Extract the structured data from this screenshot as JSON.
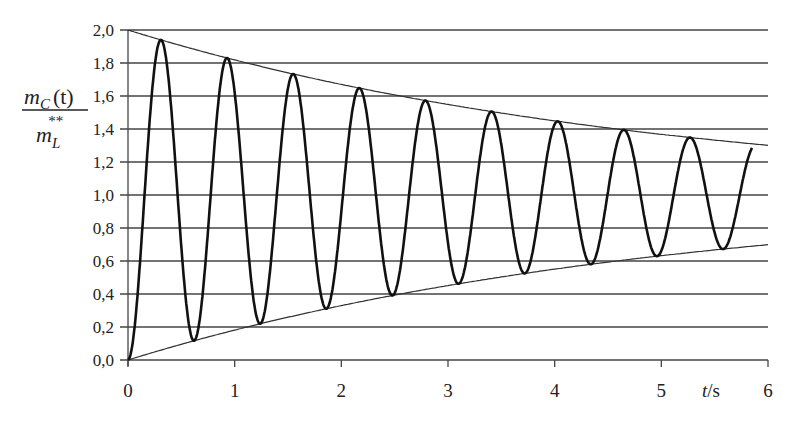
{
  "chart_data": {
    "type": "line",
    "title": "",
    "xlabel": "t/s",
    "ylabel": "m_C(t) / m_L**",
    "xlim": [
      0,
      6
    ],
    "ylim": [
      0,
      2.0
    ],
    "x_ticks": [
      "0",
      "1",
      "2",
      "3",
      "4",
      "5",
      "6"
    ],
    "y_ticks": [
      "0,0",
      "0,2",
      "0,4",
      "0,6",
      "0,8",
      "1,0",
      "1,2",
      "1,4",
      "1,6",
      "1,8",
      "2,0"
    ],
    "grid": "horizontal",
    "legend": null,
    "model": {
      "description": "damped oscillation 1 - exp(-t/tau)*cos(2*pi*t/T) with envelopes 1 +/- exp(-t/tau)",
      "tau": 5.0,
      "period": 0.62,
      "t_end": 5.85
    },
    "series": [
      {
        "name": "m_C(t)/m_L**",
        "style": "thick",
        "peaks": [
          {
            "t": 0.31,
            "y": 1.94
          },
          {
            "t": 0.93,
            "y": 1.83
          },
          {
            "t": 1.55,
            "y": 1.73
          },
          {
            "t": 2.17,
            "y": 1.65
          },
          {
            "t": 2.79,
            "y": 1.57
          },
          {
            "t": 3.41,
            "y": 1.5
          },
          {
            "t": 4.03,
            "y": 1.45
          },
          {
            "t": 4.65,
            "y": 1.39
          },
          {
            "t": 5.27,
            "y": 1.35
          }
        ],
        "troughs": [
          {
            "t": 0.62,
            "y": 0.12
          },
          {
            "t": 1.24,
            "y": 0.22
          },
          {
            "t": 1.86,
            "y": 0.31
          },
          {
            "t": 2.48,
            "y": 0.39
          },
          {
            "t": 3.1,
            "y": 0.46
          },
          {
            "t": 3.72,
            "y": 0.52
          },
          {
            "t": 4.34,
            "y": 0.58
          },
          {
            "t": 4.96,
            "y": 0.63
          },
          {
            "t": 5.58,
            "y": 0.67
          }
        ],
        "end_point": {
          "t": 5.85,
          "y": 1.27
        }
      },
      {
        "name": "upper envelope",
        "style": "thin",
        "x": [
          0,
          1,
          2,
          3,
          4,
          5,
          6
        ],
        "values": [
          2.0,
          1.82,
          1.67,
          1.55,
          1.45,
          1.37,
          1.3
        ]
      },
      {
        "name": "lower envelope",
        "style": "thin",
        "x": [
          0,
          1,
          2,
          3,
          4,
          5,
          6
        ],
        "values": [
          0.0,
          0.18,
          0.33,
          0.45,
          0.55,
          0.63,
          0.7
        ]
      }
    ]
  },
  "labels": {
    "y_numerator_m": "m",
    "y_numerator_sub": "C",
    "y_numerator_arg": "(t)",
    "y_denominator_m": "m",
    "y_denominator_sub": "L",
    "y_denominator_sup": "**",
    "x_axis_t": "t",
    "x_axis_unit": "/s"
  }
}
